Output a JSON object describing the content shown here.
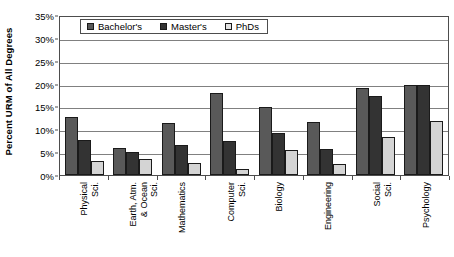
{
  "chart_data": {
    "type": "bar",
    "title": "",
    "xlabel": "",
    "ylabel": "Percent URM of All Degrees",
    "ylim": [
      0,
      35
    ],
    "ytick_labels": [
      "0%",
      "5%",
      "10%",
      "15%",
      "20%",
      "25%",
      "30%",
      "35%"
    ],
    "ytick_values": [
      0,
      5,
      10,
      15,
      20,
      25,
      30,
      35
    ],
    "grid": true,
    "legend_position": "top-left-inside",
    "categories": [
      "Physical Sci.",
      "Earth, Atm. & Ocean Sci.",
      "Mathematics",
      "Computer Sci.",
      "Biology",
      "Engineering",
      "Social Sci.",
      "Psychology"
    ],
    "category_lines": [
      [
        "Physical",
        "Sci."
      ],
      [
        "Earth, Atm.",
        "& Ocean",
        "Sci."
      ],
      [
        "Mathematics"
      ],
      [
        "Computer",
        "Sci."
      ],
      [
        "Biology"
      ],
      [
        "Engineering"
      ],
      [
        "Social",
        "Sci."
      ],
      [
        "Psychology"
      ]
    ],
    "series": [
      {
        "name": "Bachelor's",
        "color": "#595959",
        "values": [
          12.8,
          5.9,
          11.3,
          18.0,
          14.9,
          11.5,
          19.0,
          19.7
        ]
      },
      {
        "name": "Master's",
        "color": "#333333",
        "values": [
          7.7,
          5.1,
          6.6,
          7.5,
          9.3,
          5.7,
          17.2,
          19.8
        ]
      },
      {
        "name": "PhDs",
        "color": "#d4d4d4",
        "values": [
          3.1,
          3.4,
          2.7,
          1.3,
          5.4,
          2.4,
          8.4,
          11.8
        ]
      }
    ]
  },
  "legend": {
    "items": [
      {
        "label": "Bachelor's"
      },
      {
        "label": "Master's"
      },
      {
        "label": "PhDs"
      }
    ]
  }
}
